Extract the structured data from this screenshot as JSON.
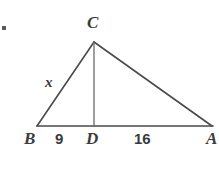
{
  "figure": {
    "kind": "geometry-diagram",
    "background_color": "#ffffff",
    "stroke_color": "#4a4a4a",
    "text_color": "#3a3a3a",
    "vertices": [
      {
        "id": "C",
        "label": "C",
        "x": 94,
        "y": 42,
        "label_x": 87,
        "label_y": 14
      },
      {
        "id": "B",
        "label": "B",
        "x": 37,
        "y": 126,
        "label_x": 24,
        "label_y": 130
      },
      {
        "id": "A",
        "label": "A",
        "x": 212,
        "y": 126,
        "label_x": 206,
        "label_y": 130
      }
    ],
    "foot": {
      "id": "D",
      "label": "D",
      "x": 94,
      "y": 126,
      "label_x": 86,
      "label_y": 130
    },
    "edges": [
      {
        "id": "BC",
        "from": "B",
        "to": "C"
      },
      {
        "id": "CA",
        "from": "C",
        "to": "A"
      },
      {
        "id": "BA",
        "from": "B",
        "to": "A"
      },
      {
        "id": "CD",
        "from": "C",
        "to": "D",
        "style": "altitude"
      }
    ],
    "measure_labels": [
      {
        "id": "BD",
        "text": "9",
        "x": 55,
        "y": 131
      },
      {
        "id": "DA",
        "text": "16",
        "x": 134,
        "y": 131
      }
    ],
    "variable_labels": [
      {
        "id": "x",
        "text": "x",
        "x": 45,
        "y": 75,
        "refers_to": "BC"
      }
    ]
  }
}
